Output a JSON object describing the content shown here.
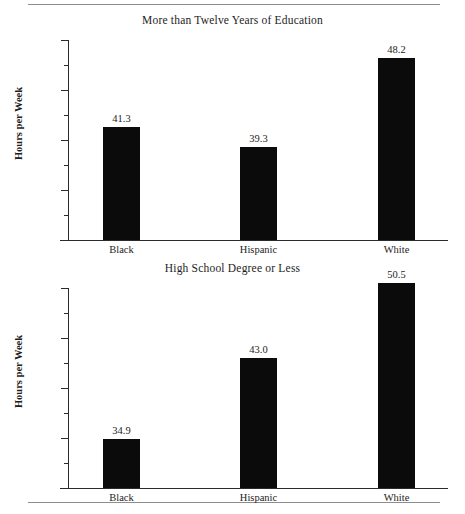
{
  "figure": {
    "rule_color": "#8d8d8d",
    "bar_color": "#0b0b0b",
    "axis_color": "#2b2b2b"
  },
  "chart_data": [
    {
      "type": "bar",
      "title": "More than Twelve Years of Education",
      "xlabel": "",
      "ylabel": "Hours per Week",
      "categories": [
        "Black",
        "Hispanic",
        "White"
      ],
      "values": [
        41.3,
        39.3,
        48.2
      ],
      "value_labels": [
        "41.3",
        "39.3",
        "48.2"
      ],
      "ylim": [
        30,
        50
      ],
      "yticks": [
        30,
        35,
        40,
        45,
        50
      ],
      "ytick_labels": [
        "30",
        "35",
        "40",
        "45",
        "50"
      ],
      "yticks_minor": [
        32.5,
        37.5,
        42.5,
        47.5
      ],
      "grid": false,
      "legend": "none"
    },
    {
      "type": "bar",
      "title": "High School Degree or Less",
      "xlabel": "",
      "ylabel": "Hours per Week",
      "categories": [
        "Black",
        "Hispanic",
        "White"
      ],
      "values": [
        34.9,
        43.0,
        50.5
      ],
      "value_labels": [
        "34.9",
        "43.0",
        "50.5"
      ],
      "ylim": [
        30,
        50
      ],
      "yticks": [
        30,
        35,
        40,
        45,
        50
      ],
      "ytick_labels": [
        "30",
        "35",
        "40",
        "45",
        "50"
      ],
      "yticks_minor": [
        32.5,
        37.5,
        42.5,
        47.5
      ],
      "grid": false,
      "legend": "none"
    }
  ]
}
